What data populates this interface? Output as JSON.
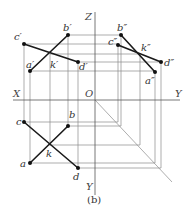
{
  "figure": {
    "caption": "(b)",
    "colors": {
      "background": "#ffffff",
      "construction": "#8a8a8a",
      "line": "#1a1a1a",
      "axis": "#555555",
      "label": "#333333"
    }
  },
  "axes": {
    "x_label": "X",
    "z_label": "Z",
    "y_right_label": "Y",
    "y_bottom_label": "Y",
    "origin_label": "O"
  },
  "front_view": {
    "points": {
      "a": {
        "label": "a′",
        "x": 30,
        "y": 71
      },
      "b": {
        "label": "b′",
        "x": 68,
        "y": 35
      },
      "c": {
        "label": "c′",
        "x": 24,
        "y": 44
      },
      "d": {
        "label": "d′",
        "x": 78,
        "y": 62
      },
      "k": {
        "label": "k′",
        "x": 50,
        "y": 54
      }
    }
  },
  "side_view": {
    "points": {
      "a": {
        "label": "a″",
        "x": 155,
        "y": 72
      },
      "b": {
        "label": "b″",
        "x": 121,
        "y": 35
      },
      "c": {
        "label": "c″",
        "x": 118,
        "y": 45
      },
      "d": {
        "label": "d″",
        "x": 161,
        "y": 62
      },
      "k": {
        "label": "k″",
        "x": 140,
        "y": 55
      }
    }
  },
  "top_view": {
    "points": {
      "a": {
        "label": "a",
        "x": 30,
        "y": 163
      },
      "b": {
        "label": "b",
        "x": 68,
        "y": 126
      },
      "c": {
        "label": "c",
        "x": 24,
        "y": 122
      },
      "d": {
        "label": "d",
        "x": 78,
        "y": 168
      },
      "k": {
        "label": "k",
        "x": 49,
        "y": 145
      }
    }
  },
  "segments": [
    "AB",
    "CD"
  ]
}
